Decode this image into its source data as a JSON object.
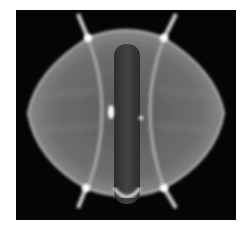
{
  "image": {
    "subject": "tokamak-plasma-fast-camera-frame",
    "colors": {
      "background": "#050505",
      "plasma_glow": "#9a9a9a",
      "edge_highlight": "#e8e8e8",
      "center_column": "#3c3c3c",
      "page_background": "#ffffff"
    }
  }
}
